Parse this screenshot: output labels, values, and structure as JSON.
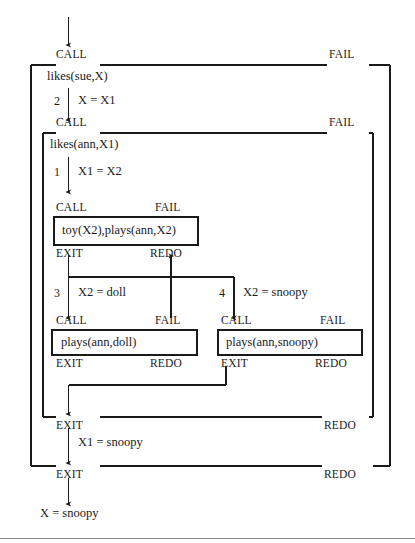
{
  "diagram": {
    "type": "byrd-box-model-trace",
    "ports": {
      "call": "CALL",
      "fail": "FAIL",
      "exit": "EXIT",
      "redo": "REDO"
    },
    "boxes": [
      {
        "id": "outer",
        "goal": "likes(sue,X)",
        "ports": {
          "call": "CALL",
          "fail": "FAIL",
          "exit": "EXIT",
          "redo": "REDO"
        }
      },
      {
        "id": "middle",
        "goal": "likes(ann,X1)",
        "ports": {
          "call": "CALL",
          "fail": "FAIL",
          "exit": "EXIT",
          "redo": "REDO"
        }
      },
      {
        "id": "conjunction",
        "goal": "toy(X2),plays(ann,X2)",
        "ports": {
          "call": "CALL",
          "fail": "FAIL",
          "exit": "EXIT",
          "redo": "REDO"
        }
      },
      {
        "id": "plays-doll",
        "goal": "plays(ann,doll)",
        "ports": {
          "call": "CALL",
          "fail": "FAIL",
          "exit": "EXIT",
          "redo": "REDO"
        }
      },
      {
        "id": "plays-snoopy",
        "goal": "plays(ann,snoopy)",
        "ports": {
          "call": "CALL",
          "fail": "FAIL",
          "exit": "EXIT",
          "redo": "REDO"
        }
      }
    ],
    "edges": [
      {
        "id": "outer-to-middle",
        "clause": "2",
        "binding": "X = X1"
      },
      {
        "id": "middle-to-conj",
        "clause": "1",
        "binding": "X1 = X2"
      },
      {
        "id": "conj-to-doll",
        "clause": "3",
        "binding": "X2 = doll"
      },
      {
        "id": "conj-to-snoopy",
        "clause": "4",
        "binding": "X2 = snoopy"
      },
      {
        "id": "middle-exit",
        "clause": "",
        "binding": "X1 = snoopy"
      },
      {
        "id": "outer-exit",
        "clause": "",
        "binding": "X = snoopy"
      }
    ],
    "labels": {
      "top_call": "CALL",
      "top_fail": "FAIL",
      "outer_goal": "likes(sue,X)",
      "edge2_num": "2",
      "edge2_text": "X = X1",
      "mid_call": "CALL",
      "mid_fail": "FAIL",
      "mid_goal": "likes(ann,X1)",
      "edge1_num": "1",
      "edge1_text": "X1 = X2",
      "conj_call": "CALL",
      "conj_fail": "FAIL",
      "conj_goal": "toy(X2),plays(ann,X2)",
      "conj_exit": "EXIT",
      "conj_redo": "REDO",
      "edge3_num": "3",
      "edge3_text": "X2 = doll",
      "edge4_num": "4",
      "edge4_text": "X2 = snoopy",
      "doll_call": "CALL",
      "doll_fail": "FAIL",
      "doll_goal": "plays(ann,doll)",
      "doll_exit": "EXIT",
      "doll_redo": "REDO",
      "snoopy_call": "CALL",
      "snoopy_fail": "FAIL",
      "snoopy_goal": "plays(ann,snoopy)",
      "snoopy_exit": "EXIT",
      "snoopy_redo": "REDO",
      "mid_exit": "EXIT",
      "mid_redo": "REDO",
      "mid_exit_binding": "X1 = snoopy",
      "outer_exit": "EXIT",
      "outer_redo": "REDO",
      "final_result": "X = snoopy"
    },
    "colors": {
      "line": "#1a1a1a",
      "text": "#1a1a1a",
      "background": "#ffffff",
      "rule": "#8a8a8a"
    }
  }
}
